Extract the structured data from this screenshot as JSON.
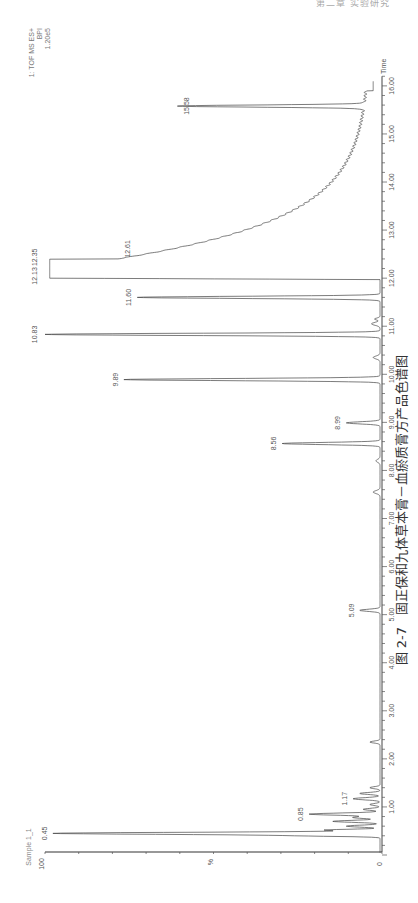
{
  "page_header": "第二章 实验研究",
  "caption": {
    "figure_number": "图 2-7",
    "title": "固正保和九体草本膏－血瘀质膏方产品色谱图"
  },
  "chart_data": {
    "type": "line",
    "orientation": "rotated-90-ccw",
    "title": "Sample 1_1",
    "detector_info": [
      "1: TOF MS ES+",
      "BPI",
      "1.20e5"
    ],
    "xlabel": "Time",
    "ylabel": "%",
    "xlim": [
      0,
      16.2
    ],
    "ylim": [
      0,
      100
    ],
    "x_ticks": [
      "1.00",
      "2.00",
      "3.00",
      "4.00",
      "5.00",
      "6.00",
      "7.00",
      "8.00",
      "9.00",
      "10.00",
      "11.00",
      "12.00",
      "13.00",
      "14.00",
      "15.00",
      "16.00"
    ],
    "y_ticks": [
      "0",
      "100"
    ],
    "grid": false,
    "peaks": [
      {
        "time": 0.45,
        "intensity": 97,
        "label": "0.45"
      },
      {
        "time": 0.85,
        "intensity": 21,
        "label": "0.85"
      },
      {
        "time": 1.17,
        "intensity": 8,
        "label": "1.17"
      },
      {
        "time": 5.09,
        "intensity": 6,
        "label": "5.09"
      },
      {
        "time": 8.56,
        "intensity": 29,
        "label": "8.56"
      },
      {
        "time": 8.99,
        "intensity": 10,
        "label": "8.99"
      },
      {
        "time": 9.89,
        "intensity": 76,
        "label": "9.89"
      },
      {
        "time": 10.83,
        "intensity": 100,
        "label": "10.83"
      },
      {
        "time": 11.6,
        "intensity": 72,
        "label": "11.60"
      },
      {
        "time": 12.13,
        "intensity": 98,
        "label": "12.13"
      },
      {
        "time": 12.35,
        "intensity": 98,
        "label": "12.35"
      },
      {
        "time": 12.61,
        "intensity": 73,
        "label": "12.61"
      },
      {
        "time": 15.58,
        "intensity": 55,
        "label": "15.58"
      }
    ],
    "annotations": {
      "tail_after_12_35": "broad decaying baseline from ~75% at 12.6 min to ~3% at 15.4 min"
    }
  }
}
